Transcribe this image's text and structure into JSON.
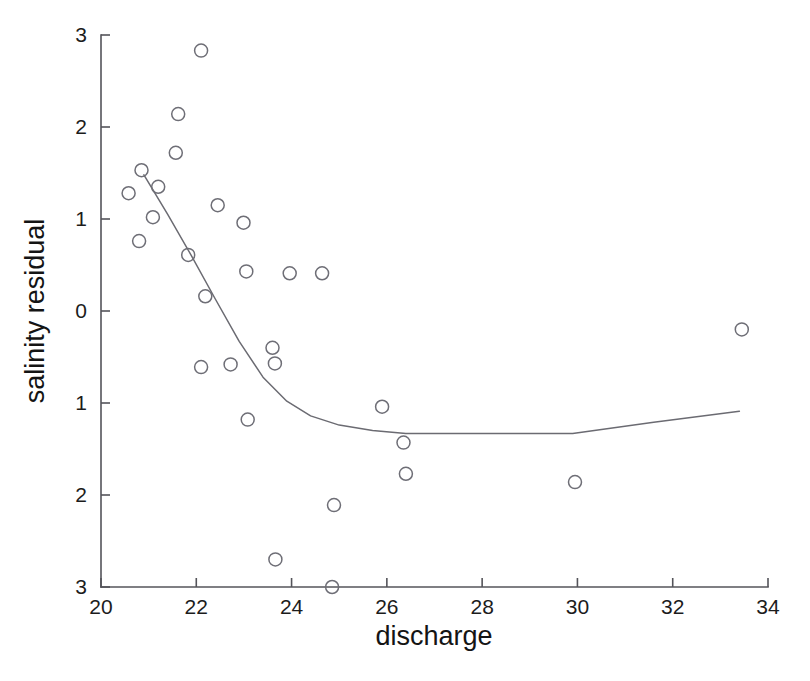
{
  "chart_data": {
    "type": "scatter",
    "title": "",
    "xlabel": "discharge",
    "ylabel": "salinity residual",
    "xlim": [
      20,
      34
    ],
    "ylim": [
      -3,
      3
    ],
    "grid": false,
    "legend": null,
    "xticks": [
      20,
      22,
      24,
      26,
      28,
      30,
      32,
      34
    ],
    "xtick_labels": [
      "20",
      "22",
      "24",
      "26",
      "28",
      "30",
      "32",
      "34"
    ],
    "yticks": [
      3,
      2,
      1,
      0,
      -1,
      -2,
      -3
    ],
    "ytick_labels": [
      "3",
      "2",
      "1",
      "0",
      "1",
      "2",
      "3"
    ],
    "ytick_note": "negative tick labels rendered without minus signs in the source figure",
    "marker": "open-circle",
    "points": [
      {
        "x": 20.58,
        "y": 1.28
      },
      {
        "x": 20.8,
        "y": 0.76
      },
      {
        "x": 20.85,
        "y": 1.53
      },
      {
        "x": 21.09,
        "y": 1.02
      },
      {
        "x": 21.2,
        "y": 1.35
      },
      {
        "x": 21.57,
        "y": 1.72
      },
      {
        "x": 21.62,
        "y": 2.14
      },
      {
        "x": 21.83,
        "y": 0.61
      },
      {
        "x": 22.1,
        "y": -0.61
      },
      {
        "x": 22.1,
        "y": 2.83
      },
      {
        "x": 22.19,
        "y": 0.16
      },
      {
        "x": 22.45,
        "y": 1.15
      },
      {
        "x": 22.72,
        "y": -0.58
      },
      {
        "x": 22.99,
        "y": 0.96
      },
      {
        "x": 23.05,
        "y": 0.43
      },
      {
        "x": 23.08,
        "y": -1.18
      },
      {
        "x": 23.6,
        "y": -0.4
      },
      {
        "x": 23.65,
        "y": -0.57
      },
      {
        "x": 23.66,
        "y": -2.7
      },
      {
        "x": 23.96,
        "y": 0.41
      },
      {
        "x": 24.64,
        "y": 0.41
      },
      {
        "x": 24.89,
        "y": -2.11
      },
      {
        "x": 24.85,
        "y": -3.0
      },
      {
        "x": 25.9,
        "y": -1.04
      },
      {
        "x": 26.35,
        "y": -1.43
      },
      {
        "x": 26.4,
        "y": -1.77
      },
      {
        "x": 29.95,
        "y": -1.86
      },
      {
        "x": 33.45,
        "y": -0.2
      }
    ],
    "fit_curve": {
      "name": "smoothed fit",
      "points": [
        {
          "x": 20.9,
          "y": 1.48
        },
        {
          "x": 21.4,
          "y": 1.05
        },
        {
          "x": 21.9,
          "y": 0.6
        },
        {
          "x": 22.4,
          "y": 0.13
        },
        {
          "x": 22.9,
          "y": -0.33
        },
        {
          "x": 23.4,
          "y": -0.72
        },
        {
          "x": 23.9,
          "y": -0.98
        },
        {
          "x": 24.4,
          "y": -1.14
        },
        {
          "x": 25.0,
          "y": -1.24
        },
        {
          "x": 25.7,
          "y": -1.3
        },
        {
          "x": 26.4,
          "y": -1.33
        },
        {
          "x": 28.0,
          "y": -1.33
        },
        {
          "x": 29.9,
          "y": -1.33
        },
        {
          "x": 31.6,
          "y": -1.21
        },
        {
          "x": 33.4,
          "y": -1.09
        }
      ]
    }
  },
  "axes": {
    "x_axis_title": "discharge",
    "y_axis_title": "salinity residual"
  }
}
